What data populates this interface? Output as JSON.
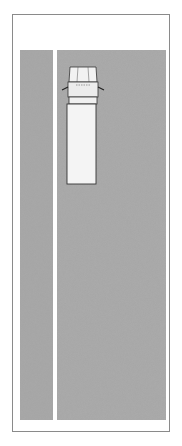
{
  "colors": {
    "road": "#a9a9a9",
    "lane_marking": "#ffffff",
    "frame": "#8a8a8a",
    "ink": "#222222"
  },
  "vehicle": {
    "type": "truck",
    "orientation": "facing-up"
  },
  "warning_triangles": [
    {
      "label": "triangle-1",
      "distance_ft": 10
    },
    {
      "label": "triangle-2",
      "distance_ft": 100
    },
    {
      "label": "triangle-3",
      "distance_ft": 200
    }
  ],
  "distances": [
    {
      "label": "10'",
      "value_ft": 10
    },
    {
      "label": "100'",
      "value_ft": 100
    },
    {
      "label": "200'",
      "value_ft": 200
    }
  ]
}
